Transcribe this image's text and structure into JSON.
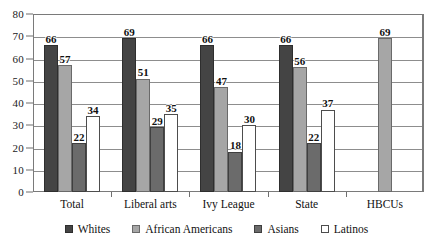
{
  "chart_data": {
    "type": "bar",
    "title": "",
    "xlabel": "",
    "ylabel": "",
    "ylim": [
      0,
      80
    ],
    "ytick_step": 10,
    "yticks": [
      0,
      10,
      20,
      30,
      40,
      50,
      60,
      70,
      80
    ],
    "grid": true,
    "legend_position": "bottom",
    "categories": [
      "Total",
      "Liberal arts",
      "Ivy League",
      "State",
      "HBCUs"
    ],
    "series": [
      {
        "name": "Whites",
        "color": "#444444",
        "values": [
          66,
          69,
          66,
          66,
          null
        ]
      },
      {
        "name": "African Americans",
        "color": "#a6a6a6",
        "values": [
          57,
          51,
          47,
          56,
          69
        ]
      },
      {
        "name": "Asians",
        "color": "#6b6b6b",
        "values": [
          22,
          29,
          18,
          22,
          null
        ]
      },
      {
        "name": "Latinos",
        "color": "#ffffff",
        "values": [
          34,
          35,
          30,
          37,
          null
        ]
      }
    ]
  },
  "axis": {
    "y_ticks": [
      "0",
      "10",
      "20",
      "30",
      "40",
      "50",
      "60",
      "70",
      "80"
    ],
    "x_labels": [
      "Total",
      "Liberal arts",
      "Ivy League",
      "State",
      "HBCUs"
    ]
  },
  "legend": {
    "items": [
      {
        "label": "Whites",
        "swatch": "whites"
      },
      {
        "label": "African Americans",
        "swatch": "african-americans"
      },
      {
        "label": "Asians",
        "swatch": "asians"
      },
      {
        "label": "Latinos",
        "swatch": "latinos"
      }
    ]
  },
  "values_flat": {
    "total": {
      "whites": "66",
      "african_americans": "57",
      "asians": "22",
      "latinos": "34"
    },
    "liberal_arts": {
      "whites": "69",
      "african_americans": "51",
      "asians": "29",
      "latinos": "35"
    },
    "ivy_league": {
      "whites": "66",
      "african_americans": "47",
      "asians": "18",
      "latinos": "30"
    },
    "state": {
      "whites": "66",
      "african_americans": "56",
      "asians": "22",
      "latinos": "37"
    },
    "hbcus": {
      "african_americans": "69"
    }
  }
}
